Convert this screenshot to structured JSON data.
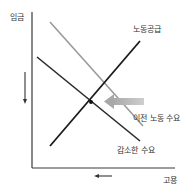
{
  "diagram": {
    "type": "supply-demand",
    "y_axis_label": "임금",
    "x_axis_label": "고용",
    "curves": {
      "supply": {
        "label": "노동공급",
        "color": "#1a1a1a"
      },
      "old_demand": {
        "label": "이전 노동 수요",
        "color": "#9a9a9a"
      },
      "new_demand": {
        "label": "감소한 수요",
        "color": "#2a2a2a"
      }
    },
    "shift_direction": "left",
    "wage_change": "down",
    "employment_change": "down",
    "colors": {
      "axis": "#3a3a3a",
      "shift_arrow": "#b8b8b8",
      "text": "#333333"
    }
  }
}
